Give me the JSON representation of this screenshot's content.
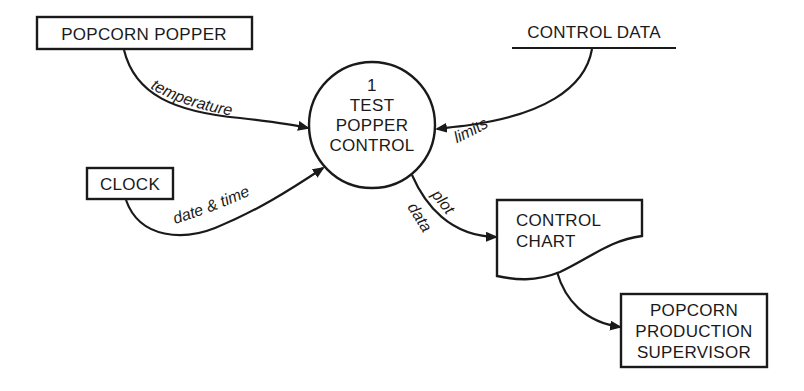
{
  "diagram": {
    "type": "data-flow-diagram",
    "process": {
      "number": "1",
      "lines": [
        "TEST",
        "POPPER",
        "CONTROL"
      ]
    },
    "external_entities": {
      "popcorn_popper": "POPCORN POPPER",
      "clock": "CLOCK",
      "supervisor": [
        "POPCORN",
        "PRODUCTION",
        "SUPERVISOR"
      ]
    },
    "data_store": {
      "control_data": "CONTROL DATA"
    },
    "document": {
      "lines": [
        "CONTROL",
        "CHART"
      ]
    },
    "flows": {
      "temperature": "temperature",
      "limits": "limits",
      "date_time": "date & time",
      "plot": "plot",
      "data": "data"
    },
    "colors": {
      "ink": "#1a1a1a",
      "background": "#ffffff"
    }
  }
}
